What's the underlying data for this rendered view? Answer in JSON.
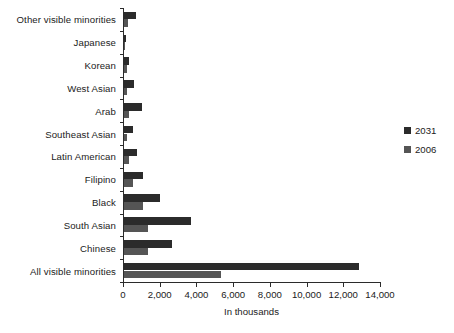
{
  "chart_data": {
    "type": "bar",
    "orientation": "horizontal",
    "title": "",
    "xlabel": "In thousands",
    "ylabel": "",
    "xlim": [
      0,
      14000
    ],
    "xticks": [
      0,
      2000,
      4000,
      6000,
      8000,
      10000,
      12000,
      14000
    ],
    "xtick_labels": [
      "0",
      "2,000",
      "4,000",
      "6,000",
      "8,000",
      "10,000",
      "12,000",
      "14,000"
    ],
    "grid": false,
    "legend_position": "right",
    "categories": [
      "Other visible minorities",
      "Japanese",
      "Korean",
      "West Asian",
      "Arab",
      "Southeast Asian",
      "Latin American",
      "Filipino",
      "Black",
      "South Asian",
      "Chinese",
      "All visible minorities"
    ],
    "series": [
      {
        "name": "2031",
        "color": "#2b2b2b",
        "values": [
          650,
          90,
          290,
          550,
          990,
          490,
          710,
          1040,
          1970,
          3670,
          2630,
          12800
        ]
      },
      {
        "name": "2006",
        "color": "#555555",
        "values": [
          220,
          80,
          145,
          180,
          250,
          150,
          250,
          490,
          1040,
          1320,
          1320,
          5300
        ]
      }
    ]
  },
  "legend": {
    "items": [
      {
        "label": "2031",
        "color": "#2b2b2b"
      },
      {
        "label": "2006",
        "color": "#555555"
      }
    ]
  }
}
